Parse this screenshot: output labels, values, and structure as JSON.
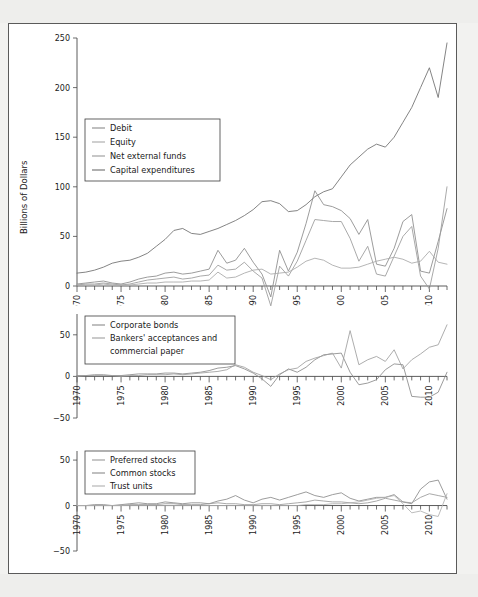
{
  "figure": {
    "y_axis_label": "Billions of Dollars",
    "background_color": "#ffffff",
    "frame_color": "#5a5a5a",
    "page_color": "#eeeeec"
  },
  "chart_data": [
    {
      "type": "line",
      "panel": "top",
      "title": "",
      "xlabel": "",
      "ylabel": "Billions of Dollars",
      "xlim": [
        1970,
        2012
      ],
      "ylim": [
        0,
        250
      ],
      "yticks": [
        0,
        50,
        100,
        150,
        200,
        250
      ],
      "xticks": [
        1970,
        1975,
        1980,
        1985,
        1990,
        1995,
        2000,
        2005,
        2010
      ],
      "xtick_labels": [
        "1970",
        "1975",
        "1980",
        "1985",
        "1990",
        "1995",
        "2000",
        "2005",
        "2010"
      ],
      "ytick_labels": [
        "0",
        "50",
        "100",
        "150",
        "200",
        "250"
      ],
      "grid": false,
      "legend_position": "upper left",
      "x": [
        1970,
        1971,
        1972,
        1973,
        1974,
        1975,
        1976,
        1977,
        1978,
        1979,
        1980,
        1981,
        1982,
        1983,
        1984,
        1985,
        1986,
        1987,
        1988,
        1989,
        1990,
        1991,
        1992,
        1993,
        1994,
        1995,
        1996,
        1997,
        1998,
        1999,
        2000,
        2001,
        2002,
        2003,
        2004,
        2005,
        2006,
        2007,
        2008,
        2009,
        2010,
        2011,
        2012
      ],
      "series": [
        {
          "name": "Capital expenditures",
          "color": "#6e6e6e",
          "values": [
            13,
            14,
            16,
            19,
            23,
            25,
            26,
            29,
            33,
            40,
            47,
            56,
            58,
            53,
            52,
            55,
            58,
            62,
            66,
            71,
            77,
            85,
            86,
            83,
            75,
            76,
            82,
            90,
            95,
            98,
            110,
            122,
            130,
            138,
            143,
            140,
            150,
            165,
            180,
            200,
            220,
            190,
            245
          ]
        },
        {
          "name": "Debit",
          "color": "#8a8a8a",
          "values": [
            2,
            3,
            4,
            5,
            3,
            2,
            4,
            7,
            9,
            10,
            13,
            14,
            12,
            13,
            15,
            17,
            36,
            23,
            26,
            38,
            24,
            12,
            -11,
            36,
            15,
            34,
            63,
            96,
            82,
            80,
            76,
            68,
            52,
            67,
            22,
            20,
            38,
            65,
            72,
            15,
            13,
            45,
            78
          ]
        },
        {
          "name": "Net external funds",
          "color": "#9a9a9a",
          "values": [
            1,
            2,
            2,
            3,
            2,
            1,
            2,
            4,
            6,
            7,
            8,
            9,
            7,
            8,
            10,
            11,
            21,
            16,
            17,
            24,
            15,
            8,
            -20,
            20,
            10,
            25,
            46,
            67,
            66,
            65,
            65,
            48,
            25,
            40,
            12,
            10,
            30,
            50,
            60,
            10,
            -3,
            38,
            100
          ]
        },
        {
          "name": "Equity",
          "color": "#a8a8a8",
          "values": [
            1,
            1,
            1,
            2,
            1,
            1,
            1,
            2,
            3,
            3,
            4,
            4,
            4,
            5,
            5,
            6,
            14,
            8,
            9,
            13,
            16,
            17,
            12,
            13,
            14,
            19,
            25,
            28,
            26,
            21,
            18,
            18,
            19,
            22,
            25,
            27,
            29,
            27,
            23,
            25,
            35,
            24,
            22
          ]
        }
      ]
    },
    {
      "type": "line",
      "panel": "middle",
      "title": "",
      "xlabel": "",
      "ylabel": "",
      "xlim": [
        1970,
        2012
      ],
      "ylim": [
        -50,
        75
      ],
      "yticks": [
        -50,
        0,
        50
      ],
      "xticks": [
        1970,
        1975,
        1980,
        1985,
        1990,
        1995,
        2000,
        2005,
        2010
      ],
      "xtick_labels": [
        "1970",
        "1975",
        "1980",
        "1985",
        "1990",
        "1995",
        "2000",
        "2005",
        "2010"
      ],
      "ytick_labels": [
        "-50",
        "0",
        "50"
      ],
      "grid": false,
      "legend_position": "upper left",
      "x": [
        1970,
        1971,
        1972,
        1973,
        1974,
        1975,
        1976,
        1977,
        1978,
        1979,
        1980,
        1981,
        1982,
        1983,
        1984,
        1985,
        1986,
        1987,
        1988,
        1989,
        1990,
        1991,
        1992,
        1993,
        1994,
        1995,
        1996,
        1997,
        1998,
        1999,
        2000,
        2001,
        2002,
        2003,
        2004,
        2005,
        2006,
        2007,
        2008,
        2009,
        2010,
        2011,
        2012
      ],
      "series": [
        {
          "name": "Corporate bonds",
          "color": "#8a8a8a",
          "values": [
            1,
            1,
            2,
            2,
            1,
            1,
            2,
            3,
            3,
            3,
            4,
            4,
            3,
            4,
            5,
            7,
            10,
            11,
            13,
            9,
            4,
            -3,
            -12,
            2,
            9,
            5,
            11,
            20,
            26,
            27,
            28,
            5,
            -10,
            -8,
            -4,
            8,
            15,
            14,
            -24,
            -25,
            -25,
            -19,
            5
          ]
        },
        {
          "name": "Bankers' acceptances and commercial paper",
          "color": "#9e9e9e",
          "values": [
            0,
            1,
            1,
            1,
            1,
            0,
            1,
            1,
            2,
            2,
            2,
            3,
            2,
            3,
            4,
            5,
            6,
            8,
            14,
            11,
            5,
            1,
            -4,
            3,
            8,
            10,
            18,
            22,
            25,
            28,
            10,
            55,
            14,
            20,
            24,
            18,
            32,
            9,
            20,
            27,
            35,
            38,
            62
          ]
        }
      ]
    },
    {
      "type": "line",
      "panel": "bottom",
      "title": "",
      "xlabel": "",
      "ylabel": "",
      "xlim": [
        1970,
        2012
      ],
      "ylim": [
        -50,
        60
      ],
      "yticks": [
        -50,
        0,
        50
      ],
      "xticks": [
        1970,
        1975,
        1980,
        1985,
        1990,
        1995,
        2000,
        2005,
        2010
      ],
      "xtick_labels": [
        "1970",
        "1975",
        "1980",
        "1985",
        "1990",
        "1995",
        "2000",
        "2005",
        "2010"
      ],
      "ytick_labels": [
        "-50",
        "0",
        "50"
      ],
      "grid": false,
      "legend_position": "upper left",
      "x": [
        1970,
        1971,
        1972,
        1973,
        1974,
        1975,
        1976,
        1977,
        1978,
        1979,
        1980,
        1981,
        1982,
        1983,
        1984,
        1985,
        1986,
        1987,
        1988,
        1989,
        1990,
        1991,
        1992,
        1993,
        1994,
        1995,
        1996,
        1997,
        1998,
        1999,
        2000,
        2001,
        2002,
        2003,
        2004,
        2005,
        2006,
        2007,
        2008,
        2009,
        2010,
        2011,
        2012
      ],
      "series": [
        {
          "name": "Common stocks",
          "color": "#8a8a8a",
          "values": [
            0,
            0,
            1,
            1,
            0,
            1,
            2,
            3,
            2,
            2,
            4,
            3,
            2,
            3,
            3,
            2,
            5,
            7,
            11,
            6,
            3,
            7,
            9,
            6,
            9,
            12,
            15,
            11,
            9,
            12,
            14,
            8,
            5,
            7,
            9,
            9,
            12,
            4,
            2,
            18,
            26,
            28,
            7
          ]
        },
        {
          "name": "Preferred stocks",
          "color": "#9a9a9a",
          "values": [
            0,
            0,
            0,
            0,
            0,
            0,
            1,
            1,
            1,
            1,
            2,
            2,
            1,
            1,
            1,
            2,
            3,
            2,
            2,
            1,
            1,
            2,
            2,
            1,
            2,
            3,
            4,
            6,
            5,
            4,
            4,
            3,
            2,
            3,
            5,
            8,
            6,
            4,
            3,
            9,
            13,
            11,
            9
          ]
        },
        {
          "name": "Trust units",
          "color": "#b0b0b0",
          "values": [
            0,
            0,
            0,
            0,
            0,
            0,
            0,
            0,
            0,
            0,
            0,
            0,
            0,
            0,
            0,
            0,
            0,
            0,
            0,
            0,
            0,
            0,
            0,
            0,
            0,
            0,
            1,
            1,
            1,
            2,
            2,
            3,
            4,
            6,
            8,
            9,
            11,
            2,
            -8,
            -6,
            -10,
            -12,
            13
          ]
        }
      ]
    }
  ],
  "panels": {
    "top": {
      "legend": {
        "items": [
          {
            "label": "Debit",
            "color": "#8a8a8a"
          },
          {
            "label": "Equity",
            "color": "#a8a8a8"
          },
          {
            "label": "Net external funds",
            "color": "#9a9a9a"
          },
          {
            "label": "Capital expenditures",
            "color": "#6e6e6e"
          }
        ]
      }
    },
    "middle": {
      "legend": {
        "items": [
          {
            "label": "Corporate bonds",
            "color": "#8a8a8a"
          },
          {
            "label": "Bankers' acceptances and",
            "color": "#9e9e9e"
          },
          {
            "label": "commercial paper",
            "color": null
          }
        ]
      }
    },
    "bottom": {
      "legend": {
        "items": [
          {
            "label": "Preferred stocks",
            "color": "#9a9a9a"
          },
          {
            "label": "Common stocks",
            "color": "#8a8a8a"
          },
          {
            "label": "Trust units",
            "color": "#b0b0b0"
          }
        ]
      }
    }
  }
}
